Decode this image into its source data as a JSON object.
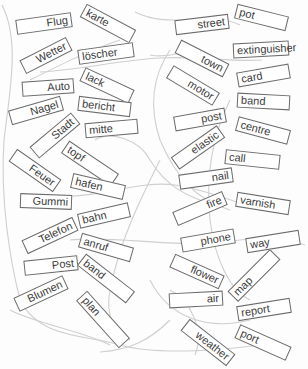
{
  "worksheet": {
    "german_words": [
      {
        "text": "Flug"
      },
      {
        "text": "Wetter"
      },
      {
        "text": "Auto"
      },
      {
        "text": "Nagel"
      },
      {
        "text": "Stadt"
      },
      {
        "text": "Feuer"
      },
      {
        "text": "Gummi"
      },
      {
        "text": "Telefon"
      },
      {
        "text": "Post"
      },
      {
        "text": "Blumen"
      }
    ],
    "german_endings": [
      {
        "text": "karte"
      },
      {
        "text": "löscher"
      },
      {
        "text": "lack"
      },
      {
        "text": "bericht"
      },
      {
        "text": "mitte"
      },
      {
        "text": "topf"
      },
      {
        "text": "hafen"
      },
      {
        "text": "bahn"
      },
      {
        "text": "anruf"
      },
      {
        "text": "band"
      },
      {
        "text": "plan"
      }
    ],
    "english_words": [
      {
        "text": "street"
      },
      {
        "text": "town"
      },
      {
        "text": "motor"
      },
      {
        "text": "post"
      },
      {
        "text": "elastic"
      },
      {
        "text": "nail"
      },
      {
        "text": "fire"
      },
      {
        "text": "phone"
      },
      {
        "text": "flower"
      },
      {
        "text": "air"
      },
      {
        "text": "weather"
      }
    ],
    "english_endings": [
      {
        "text": "pot"
      },
      {
        "text": "extinguisher"
      },
      {
        "text": "card"
      },
      {
        "text": "band"
      },
      {
        "text": "centre"
      },
      {
        "text": "call"
      },
      {
        "text": "varnish"
      },
      {
        "text": "way"
      },
      {
        "text": "map"
      },
      {
        "text": "report"
      },
      {
        "text": "port"
      }
    ],
    "colors": {
      "border": "#6a6a6a",
      "text": "#3a3a3a",
      "pencil_line": "#c8c8c8"
    }
  }
}
